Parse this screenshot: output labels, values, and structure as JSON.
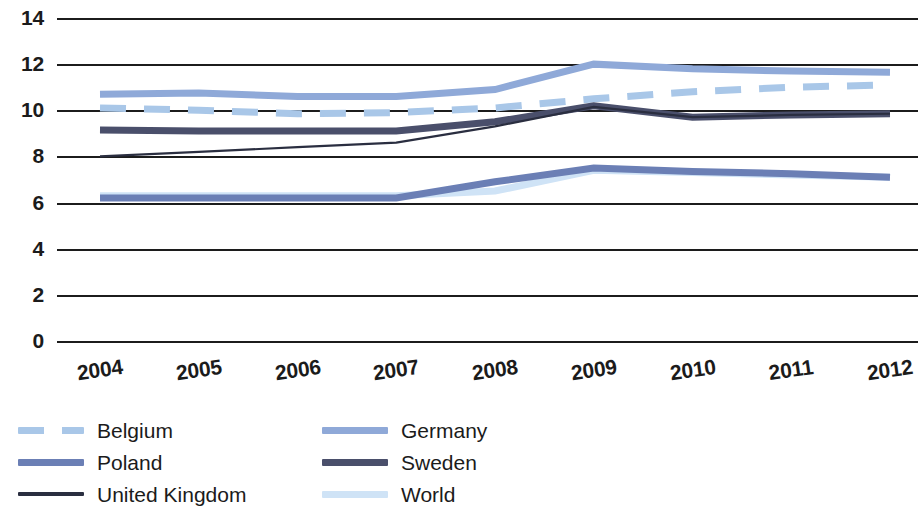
{
  "chart_data": {
    "type": "line",
    "title": "",
    "subtitle": "",
    "xlabel": "",
    "ylabel": "",
    "categories": [
      "2004",
      "2005",
      "2006",
      "2007",
      "2008",
      "2009",
      "2010",
      "2011",
      "2012"
    ],
    "x": [
      2004,
      2005,
      2006,
      2007,
      2008,
      2009,
      2010,
      2011,
      2012
    ],
    "ylim": [
      0,
      14
    ],
    "xlim": [
      2004,
      2012
    ],
    "y_ticks": [
      "0",
      "2",
      "4",
      "6",
      "8",
      "10",
      "12",
      "14"
    ],
    "y_tick_values": [
      0,
      2,
      4,
      6,
      8,
      10,
      12,
      14
    ],
    "grid": "horizontal",
    "legend_position": "bottom-left",
    "series": [
      {
        "name": "Belgium",
        "color": "#a9c7e8",
        "style": "dashed",
        "width": 7,
        "values": [
          10.1,
          10.0,
          9.85,
          9.9,
          10.1,
          10.5,
          10.8,
          11.0,
          11.1
        ]
      },
      {
        "name": "Germany",
        "color": "#8fa9d8",
        "style": "solid",
        "width": 7,
        "values": [
          10.7,
          10.75,
          10.6,
          10.6,
          10.9,
          12.0,
          11.8,
          11.7,
          11.65
        ]
      },
      {
        "name": "Poland",
        "color": "#6b7fb5",
        "style": "solid",
        "width": 7,
        "values": [
          6.2,
          6.2,
          6.2,
          6.2,
          6.9,
          7.5,
          7.35,
          7.25,
          7.1
        ]
      },
      {
        "name": "Sweden",
        "color": "#4a4f6b",
        "style": "solid",
        "width": 7,
        "values": [
          9.15,
          9.1,
          9.1,
          9.1,
          9.5,
          10.2,
          9.7,
          9.8,
          9.85
        ]
      },
      {
        "name": "United Kingdom",
        "color": "#2a2e40",
        "style": "solid",
        "width": 2.2,
        "values": [
          8.0,
          8.2,
          8.4,
          8.6,
          9.3,
          10.15,
          9.7,
          9.8,
          9.85
        ]
      },
      {
        "name": "World",
        "color": "#cfe3f6",
        "style": "solid",
        "width": 7,
        "values": [
          6.3,
          6.3,
          6.3,
          6.3,
          6.5,
          7.4,
          7.3,
          7.2,
          7.1
        ]
      }
    ]
  },
  "legend": {
    "columns": [
      {
        "items": [
          "Belgium",
          "Poland",
          "United Kingdom"
        ]
      },
      {
        "items": [
          "Germany",
          "Sweden",
          "World"
        ]
      }
    ]
  },
  "colors": {
    "axis": "#1c1c1c",
    "text": "#1b1b1b",
    "background": "#ffffff",
    "belgium": "#a9c7e8",
    "germany": "#8fa9d8",
    "poland": "#6b7fb5",
    "sweden": "#4a4f6b",
    "united_kingdom": "#2a2e40",
    "world": "#cfe3f6"
  }
}
